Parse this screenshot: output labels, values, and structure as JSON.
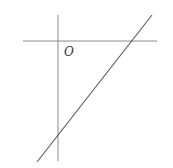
{
  "diagram": {
    "origin_label": "O",
    "colors": {
      "axis": "#8a8a8a",
      "line": "#555555",
      "background": "#ffffff"
    },
    "axes": {
      "x_axis": {
        "x1": 23,
        "y1": 41,
        "x2": 157,
        "y2": 41
      },
      "y_axis": {
        "x1": 58,
        "y1": 15,
        "x2": 58,
        "y2": 161
      }
    },
    "line": {
      "x1": 37,
      "y1": 162,
      "x2": 152,
      "y2": 15
    }
  }
}
